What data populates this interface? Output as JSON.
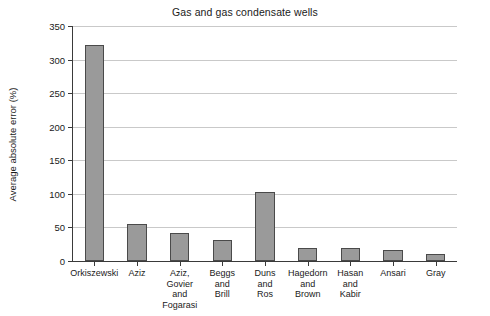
{
  "chart_data": {
    "type": "bar",
    "title": "Gas and gas condensate wells",
    "xlabel": "",
    "ylabel": "Average absolute error (%)",
    "ylim": [
      0,
      350
    ],
    "yticks": [
      0,
      50,
      100,
      150,
      200,
      250,
      300,
      350
    ],
    "ytick_labels": [
      "0",
      "50",
      "100",
      "150",
      "200",
      "250",
      "300",
      "350"
    ],
    "grid": true,
    "legend": "none",
    "bar_color": "#9a9a9a",
    "bar_edge_color": "#4a4a4a",
    "categories": [
      "Orkiszewski",
      "Aziz",
      "Aziz, Govier and Fogarasi",
      "Beggs and Brill",
      "Duns and Ros",
      "Hagedorn and Brown",
      "Hasan and Kabir",
      "Ansari",
      "Gray"
    ],
    "category_lines": [
      [
        "Orkiszewski"
      ],
      [
        "Aziz"
      ],
      [
        "Aziz,",
        "Govier",
        "and",
        "Fogarasi"
      ],
      [
        "Beggs",
        "and",
        "Brill"
      ],
      [
        "Duns",
        "and",
        "Ros"
      ],
      [
        "Hagedorn",
        "and",
        "Brown"
      ],
      [
        "Hasan",
        "and",
        "Kabir"
      ],
      [
        "Ansari"
      ],
      [
        "Gray"
      ]
    ],
    "values": [
      322,
      55,
      41,
      31,
      103,
      20,
      19,
      17,
      11
    ]
  }
}
